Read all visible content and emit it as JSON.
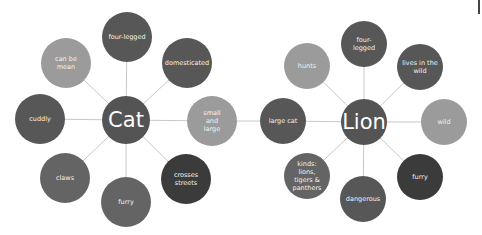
{
  "colors": {
    "hub": "#545454",
    "dark": "#3b3b3b",
    "medium_dark": "#575757",
    "medium": "#646464",
    "light": "#9b9b9b",
    "line": "#c8c8c8"
  },
  "diagrams": [
    {
      "hub": {
        "label": "Cat",
        "x": 126,
        "y": 120,
        "r": 24,
        "color": "#545454"
      },
      "nodes": [
        {
          "label": "four-legged",
          "x": 127,
          "y": 37,
          "r": 25,
          "color": "#575757"
        },
        {
          "label": "domesticated",
          "x": 187,
          "y": 63,
          "r": 25,
          "color": "#575757"
        },
        {
          "label": "small and large",
          "x": 212,
          "y": 121,
          "r": 25,
          "color": "#9b9b9b"
        },
        {
          "label": "crosses streets",
          "x": 186,
          "y": 179,
          "r": 25,
          "color": "#3b3b3b"
        },
        {
          "label": "furry",
          "x": 126,
          "y": 202,
          "r": 25,
          "color": "#646464"
        },
        {
          "label": "claws",
          "x": 65,
          "y": 178,
          "r": 25,
          "color": "#646464"
        },
        {
          "label": "cuddly",
          "x": 40,
          "y": 119,
          "r": 25,
          "color": "#575757"
        },
        {
          "label": "can be mean",
          "x": 66,
          "y": 63,
          "r": 25,
          "color": "#9b9b9b"
        }
      ]
    },
    {
      "hub": {
        "label": "Lion",
        "x": 364,
        "y": 122,
        "r": 23,
        "color": "#545454"
      },
      "nodes": [
        {
          "label": "four-legged",
          "x": 364,
          "y": 44,
          "r": 23,
          "color": "#575757"
        },
        {
          "label": "lives in the wild",
          "x": 420,
          "y": 67,
          "r": 23,
          "color": "#575757"
        },
        {
          "label": "wild",
          "x": 444,
          "y": 122,
          "r": 23,
          "color": "#9b9b9b"
        },
        {
          "label": "furry",
          "x": 420,
          "y": 177,
          "r": 23,
          "color": "#3b3b3b"
        },
        {
          "label": "dangerous",
          "x": 363,
          "y": 199,
          "r": 23,
          "color": "#575757"
        },
        {
          "label": "kinds: lions, tigers & panthers",
          "x": 307,
          "y": 176,
          "r": 23,
          "color": "#646464"
        },
        {
          "label": "large cat",
          "x": 283,
          "y": 121,
          "r": 23,
          "color": "#575757"
        },
        {
          "label": "hunts",
          "x": 307,
          "y": 66,
          "r": 23,
          "color": "#9b9b9b"
        }
      ]
    }
  ],
  "bridge": {
    "from": "small and large",
    "to": "large cat"
  }
}
